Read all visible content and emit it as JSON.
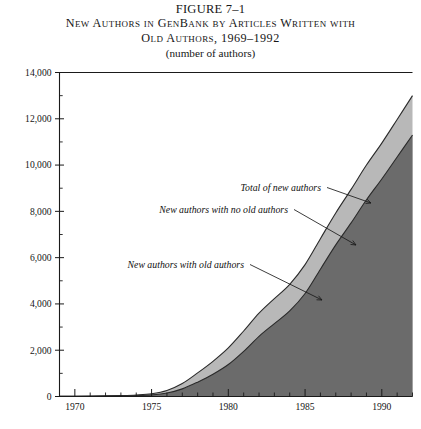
{
  "header": {
    "figure_number": "FIGURE 7–1",
    "title_line1": "New Authors in GenBank by Articles Written with",
    "title_line2": "Old Authors, 1969–1992",
    "subtitle": "(number of authors)"
  },
  "colors": {
    "band_total": "#b8b8b8",
    "band_with_old": "#6b6b6b",
    "outline": "#2a2a2a",
    "axis": "#1a1a1a",
    "background": "#ffffff"
  },
  "chart_data": {
    "type": "area",
    "stacked": true,
    "title": "New Authors in GenBank by Articles Written with Old Authors, 1969–1992",
    "subtitle": "(number of authors)",
    "xlabel": "",
    "ylabel": "",
    "ylim": [
      0,
      14000
    ],
    "xlim": [
      1969,
      1992
    ],
    "grid": false,
    "legend": "annotations",
    "y_ticks": [
      0,
      2000,
      4000,
      6000,
      8000,
      10000,
      12000,
      14000
    ],
    "y_tick_labels": [
      "0",
      "2,000",
      "4,000",
      "6,000",
      "8,000",
      "10,000",
      "12,000",
      "14,000"
    ],
    "y_minor_tick_step": 1000,
    "x_ticks": [
      1970,
      1975,
      1980,
      1985,
      1990
    ],
    "x_tick_labels": [
      "1970",
      "1975",
      "1980",
      "1985",
      "1990"
    ],
    "x_minor_tick_step": 1,
    "x": [
      1969,
      1970,
      1971,
      1972,
      1973,
      1974,
      1975,
      1976,
      1977,
      1978,
      1979,
      1980,
      1981,
      1982,
      1983,
      1984,
      1985,
      1986,
      1987,
      1988,
      1989,
      1990,
      1991,
      1992
    ],
    "series": [
      {
        "name": "New authors with old authors",
        "color": "#6b6b6b",
        "values": [
          5,
          8,
          12,
          18,
          26,
          40,
          70,
          150,
          330,
          620,
          960,
          1380,
          1950,
          2600,
          3150,
          3700,
          4450,
          5500,
          6550,
          7500,
          8500,
          9400,
          10350,
          11300
        ]
      },
      {
        "name": "New authors with no old authors",
        "color": "#b8b8b8",
        "values": [
          3,
          5,
          8,
          12,
          18,
          28,
          50,
          110,
          230,
          400,
          560,
          720,
          880,
          1000,
          1080,
          1150,
          1250,
          1320,
          1380,
          1450,
          1500,
          1550,
          1620,
          1700
        ]
      }
    ],
    "total": {
      "name": "Total of new authors",
      "values": [
        8,
        13,
        20,
        30,
        44,
        68,
        120,
        260,
        560,
        1020,
        1520,
        2100,
        2830,
        3600,
        4230,
        4850,
        5700,
        6820,
        7930,
        8950,
        10000,
        10950,
        11970,
        13000
      ]
    },
    "annotations": [
      {
        "text": "Total of new authors",
        "target_year": 1989.2,
        "target_value": 10100
      },
      {
        "text": "New authors with no old authors",
        "target_year": 1987.3,
        "target_value": 7300
      },
      {
        "text": "New authors with old authors",
        "target_year": 1984.0,
        "target_value": 3750
      }
    ]
  }
}
